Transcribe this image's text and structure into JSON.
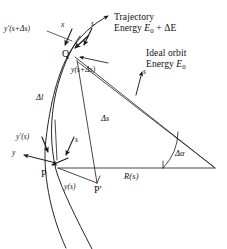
{
  "figure": {
    "domain": "diagram",
    "background_color": "#ffffff",
    "stroke_color": "#1a1a1a",
    "text_color": "#111111"
  },
  "annotations": {
    "trajectory_title": "Trajectory",
    "trajectory_energy_prefix": "Energy ",
    "trajectory_energy_symbol": "E",
    "trajectory_energy_sub": "0",
    "trajectory_energy_suffix": " + ΔE",
    "ideal_title": "Ideal orbit",
    "ideal_energy_prefix": "Energy ",
    "ideal_energy_symbol": "E",
    "ideal_energy_sub": "0"
  },
  "labels": {
    "y_prime_s_plus_ds": "y'(s+Δs)",
    "y_s_plus_ds": "y(s+Δs)",
    "y_prime_s": "y'(s)",
    "y_s": "y(s)",
    "delta_l": "Δl",
    "delta_s": "Δs",
    "delta_alpha": "Δα",
    "radius": "R(s)",
    "axis_s_at_q": "s",
    "axis_x_at_q": "x",
    "axis_s_ideal": "s",
    "axis_s_at_p": "s",
    "axis_y_at_p": "y"
  },
  "points": {
    "p": "P",
    "p_prime": "P'",
    "q": "Q"
  }
}
